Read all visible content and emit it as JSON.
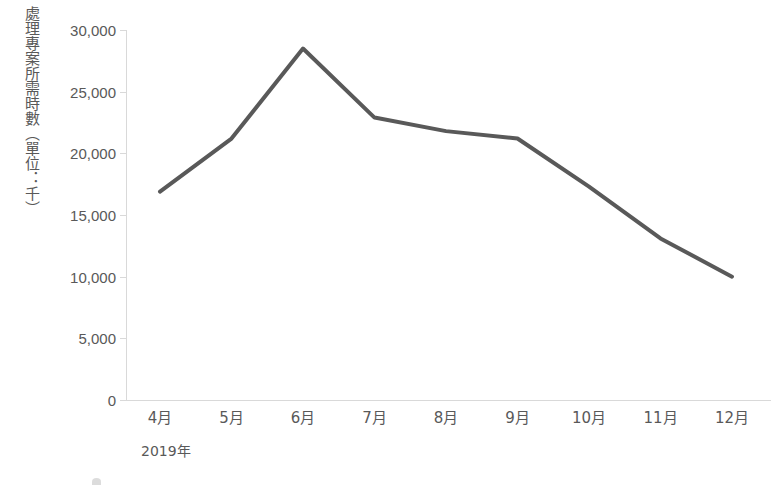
{
  "chart_data": {
    "type": "line",
    "title": "",
    "xlabel": "2019年",
    "ylabel": "處理專案所需時數（單位：千）",
    "categories": [
      "4月",
      "5月",
      "6月",
      "7月",
      "8月",
      "9月",
      "10月",
      "11月",
      "12月"
    ],
    "values": [
      16900,
      21200,
      28500,
      22900,
      21800,
      21200,
      17300,
      13100,
      10000
    ],
    "series": [
      {
        "name": "處理專案所需時數",
        "values": [
          16900,
          21200,
          28500,
          22900,
          21800,
          21200,
          17300,
          13100,
          10000
        ],
        "color": "#595959"
      }
    ],
    "ylim": [
      0,
      30000
    ],
    "y_ticks": [
      0,
      5000,
      10000,
      15000,
      20000,
      25000,
      30000
    ],
    "y_tick_labels": [
      "0",
      "5,000",
      "10,000",
      "15,000",
      "20,000",
      "25,000",
      "30,000"
    ],
    "grid": false,
    "legend": "none",
    "axis_color": "#d9d9d9",
    "text_color": "#595959",
    "line_color": "#595959",
    "line_width": 4,
    "background": "#ffffff"
  }
}
